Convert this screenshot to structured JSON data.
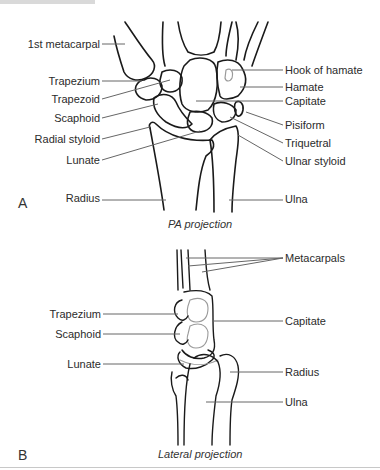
{
  "figure": {
    "panel_a": {
      "letter": "A",
      "caption": "PA projection",
      "labels_left": [
        "1st metacarpal",
        "Trapezium",
        "Trapezoid",
        "Scaphoid",
        "Radial styloid",
        "Lunate",
        "Radius"
      ],
      "labels_right": [
        "Hook of hamate",
        "Hamate",
        "Capitate",
        "Pisiform",
        "Triquetral",
        "Ulnar styloid",
        "Ulna"
      ]
    },
    "panel_b": {
      "letter": "B",
      "caption": "Lateral projection",
      "labels_left": [
        "Trapezium",
        "Scaphoid",
        "Lunate"
      ],
      "labels_right": [
        "Metacarpals",
        "Capitate",
        "Radius",
        "Ulna"
      ]
    },
    "colors": {
      "bone_outline": "#1a1a1a",
      "leader_line": "#666666",
      "inner_line": "#9a9a9a"
    }
  }
}
